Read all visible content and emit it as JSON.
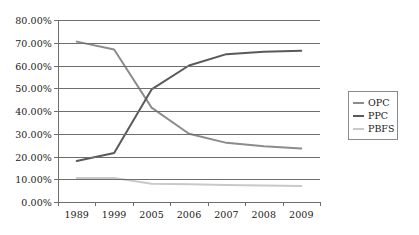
{
  "chart_data": {
    "type": "line",
    "title": "",
    "subtitle": "",
    "xlabel": "",
    "ylabel": "",
    "categories": [
      "1989",
      "1999",
      "2005",
      "2006",
      "2007",
      "2008",
      "2009"
    ],
    "ylim": [
      0,
      80
    ],
    "ytick_labels": [
      "0.00%",
      "10.00%",
      "20.00%",
      "30.00%",
      "40.00%",
      "50.00%",
      "60.00%",
      "70.00%",
      "80.00%"
    ],
    "ytick_values": [
      0,
      10,
      20,
      30,
      40,
      50,
      60,
      70,
      80
    ],
    "grid": true,
    "legend_position": "right",
    "series": [
      {
        "name": "OPC",
        "color": "#8c8c8c",
        "values": [
          70.5,
          67.0,
          41.5,
          30.0,
          26.0,
          24.5,
          23.5
        ]
      },
      {
        "name": "PPC",
        "color": "#595959",
        "values": [
          18.0,
          21.5,
          49.5,
          60.0,
          65.0,
          66.0,
          66.5
        ]
      },
      {
        "name": "PBFS",
        "color": "#c9c9c9",
        "values": [
          10.5,
          10.5,
          8.0,
          7.8,
          7.5,
          7.2,
          7.0
        ]
      }
    ]
  },
  "legend": {
    "items": [
      {
        "label": "OPC"
      },
      {
        "label": "PPC"
      },
      {
        "label": "PBFS"
      }
    ]
  },
  "colors": {
    "axis": "#6e6e6e",
    "grid": "#6e6e6e",
    "text": "#1a1a1a",
    "background": "#ffffff",
    "legend_border": "#8a8a8a"
  }
}
